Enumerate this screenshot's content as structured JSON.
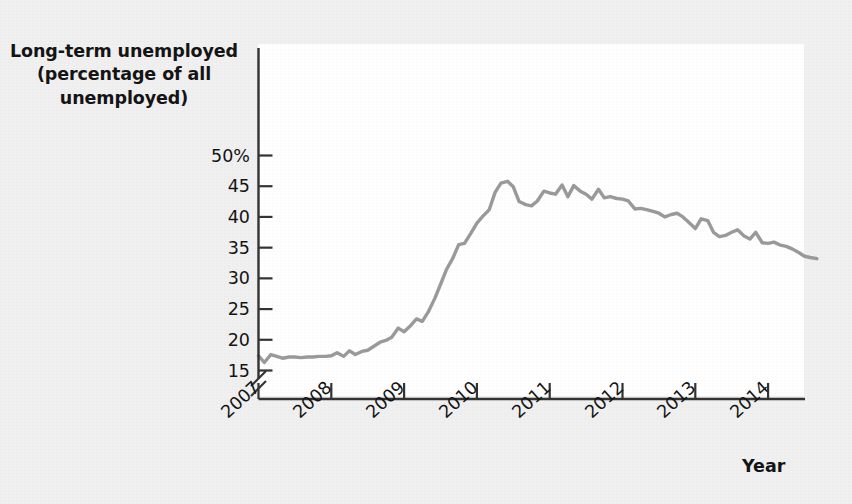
{
  "figure": {
    "background_color": "#f0f0f0",
    "plot_background_color": "#ffffff",
    "line_color": "#9a9a9a",
    "axis_color": "#333333",
    "text_color": "#141414"
  },
  "labels": {
    "y_axis_title": "Long-term unemployed (percentage of all unemployed)",
    "y_axis_title_line1": "Long-term unemployed",
    "y_axis_title_line2": "(percentage of all",
    "y_axis_title_line3": "unemployed)",
    "x_axis_title": "Year"
  },
  "chart_data": {
    "type": "line",
    "title": "",
    "subtitle": "",
    "xlabel": "Year",
    "ylabel": "Long-term unemployed (percentage of all unemployed)",
    "xlim": [
      2007.0,
      2014.75
    ],
    "ylim": [
      13.5,
      50
    ],
    "y_axis_break": true,
    "grid": false,
    "legend": false,
    "legend_position": "none",
    "y_ticks": [
      50,
      45,
      40,
      35,
      30,
      25,
      20,
      15
    ],
    "y_tick_labels": [
      "50%",
      "45",
      "40",
      "35",
      "30",
      "25",
      "20",
      "15"
    ],
    "x_ticks": [
      2007,
      2008,
      2009,
      2010,
      2011,
      2012,
      2013,
      2014
    ],
    "x_tick_labels": [
      "2007",
      "2008",
      "2009",
      "2010",
      "2011",
      "2012",
      "2013",
      "2014"
    ],
    "series": [
      {
        "name": "Long-term unemployed share",
        "color": "#9a9a9a",
        "x": [
          2007.0,
          2007.08,
          2007.17,
          2007.25,
          2007.33,
          2007.42,
          2007.5,
          2007.58,
          2007.67,
          2007.75,
          2007.83,
          2007.92,
          2008.0,
          2008.08,
          2008.17,
          2008.25,
          2008.33,
          2008.42,
          2008.5,
          2008.58,
          2008.67,
          2008.75,
          2008.83,
          2008.92,
          2009.0,
          2009.08,
          2009.17,
          2009.25,
          2009.33,
          2009.42,
          2009.5,
          2009.58,
          2009.67,
          2009.75,
          2009.83,
          2009.92,
          2010.0,
          2010.08,
          2010.17,
          2010.25,
          2010.33,
          2010.42,
          2010.5,
          2010.58,
          2010.67,
          2010.75,
          2010.83,
          2010.92,
          2011.0,
          2011.08,
          2011.17,
          2011.25,
          2011.33,
          2011.42,
          2011.5,
          2011.58,
          2011.67,
          2011.75,
          2011.83,
          2011.92,
          2012.0,
          2012.08,
          2012.17,
          2012.25,
          2012.33,
          2012.42,
          2012.5,
          2012.58,
          2012.67,
          2012.75,
          2012.83,
          2012.92,
          2013.0,
          2013.08,
          2013.17,
          2013.25,
          2013.33,
          2013.42,
          2013.5,
          2013.58,
          2013.67,
          2013.75,
          2013.83,
          2013.92,
          2014.0,
          2014.08,
          2014.17,
          2014.25,
          2014.33,
          2014.42,
          2014.5,
          2014.58,
          2014.67
        ],
        "y": [
          17.4,
          16.3,
          17.6,
          17.3,
          17.0,
          17.2,
          17.2,
          17.1,
          17.2,
          17.2,
          17.3,
          17.3,
          17.4,
          17.9,
          17.3,
          18.2,
          17.6,
          18.1,
          18.3,
          18.9,
          19.6,
          19.9,
          20.4,
          21.9,
          21.3,
          22.2,
          23.4,
          23.0,
          24.5,
          26.7,
          29.0,
          31.4,
          33.3,
          35.5,
          35.7,
          37.4,
          39.0,
          40.1,
          41.2,
          44.0,
          45.5,
          45.8,
          44.9,
          42.5,
          42.0,
          41.8,
          42.6,
          44.2,
          43.9,
          43.7,
          45.2,
          43.3,
          45.1,
          44.2,
          43.7,
          42.9,
          44.5,
          43.1,
          43.3,
          43.0,
          42.9,
          42.6,
          41.3,
          41.4,
          41.2,
          40.9,
          40.6,
          40.0,
          40.4,
          40.6,
          40.0,
          39.0,
          38.1,
          39.7,
          39.4,
          37.5,
          36.8,
          37.0,
          37.5,
          37.9,
          36.9,
          36.4,
          37.5,
          35.8,
          35.7,
          35.9,
          35.4,
          35.2,
          34.8,
          34.2,
          33.6,
          33.4,
          33.2
        ]
      }
    ]
  }
}
